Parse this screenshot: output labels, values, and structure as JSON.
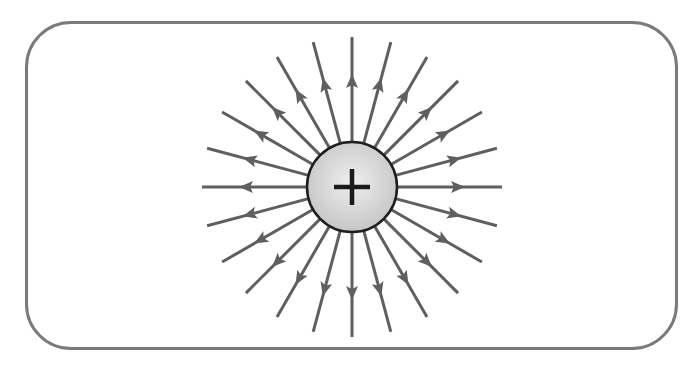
{
  "diagram": {
    "title": "Electric field lines of a positive point charge",
    "frame": {
      "border_color": "#7a7a7a",
      "background": "#ffffff"
    },
    "charge": {
      "sign_label": "+",
      "polarity": "positive",
      "center": [
        352,
        187
      ],
      "radius": 45,
      "fill_inner": "#efefef",
      "fill_outer": "#c6c6c6",
      "outline_color": "#1e1e1e",
      "sign_color": "#1a1a1a"
    },
    "field_lines": {
      "count": 24,
      "angle_step_deg": 15,
      "inner_radius": 45,
      "outer_radius": 150,
      "direction": "outward",
      "color": "#5f5f5f",
      "stroke_width": 3,
      "arrow": {
        "tip_radius": 113,
        "length": 14,
        "half_width": 6,
        "icon": "arrowhead-outward"
      }
    }
  }
}
